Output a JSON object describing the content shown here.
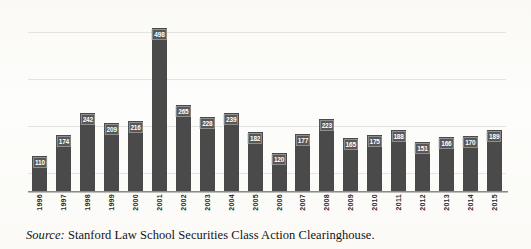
{
  "chart_data": {
    "type": "bar",
    "title": "",
    "xlabel": "",
    "ylabel": "",
    "categories": [
      "1996",
      "1997",
      "1998",
      "1999",
      "2000",
      "2001",
      "2002",
      "2003",
      "2004",
      "2005",
      "2006",
      "2007",
      "2008",
      "2009",
      "2010",
      "2011",
      "2012",
      "2013",
      "2014",
      "2015"
    ],
    "values": [
      110,
      174,
      242,
      209,
      216,
      498,
      265,
      228,
      239,
      182,
      120,
      177,
      223,
      165,
      175,
      188,
      151,
      166,
      170,
      189
    ],
    "ylim": [
      0,
      560
    ],
    "gridlines": 4,
    "grid": true,
    "legend": null,
    "axis_tick_labels_y": [],
    "bar_color": "#4a4a4a",
    "value_label_color": "#ffffff"
  },
  "source": {
    "lead": "Source:",
    "text": " Stanford Law School Securities Class Action Clearinghouse."
  }
}
